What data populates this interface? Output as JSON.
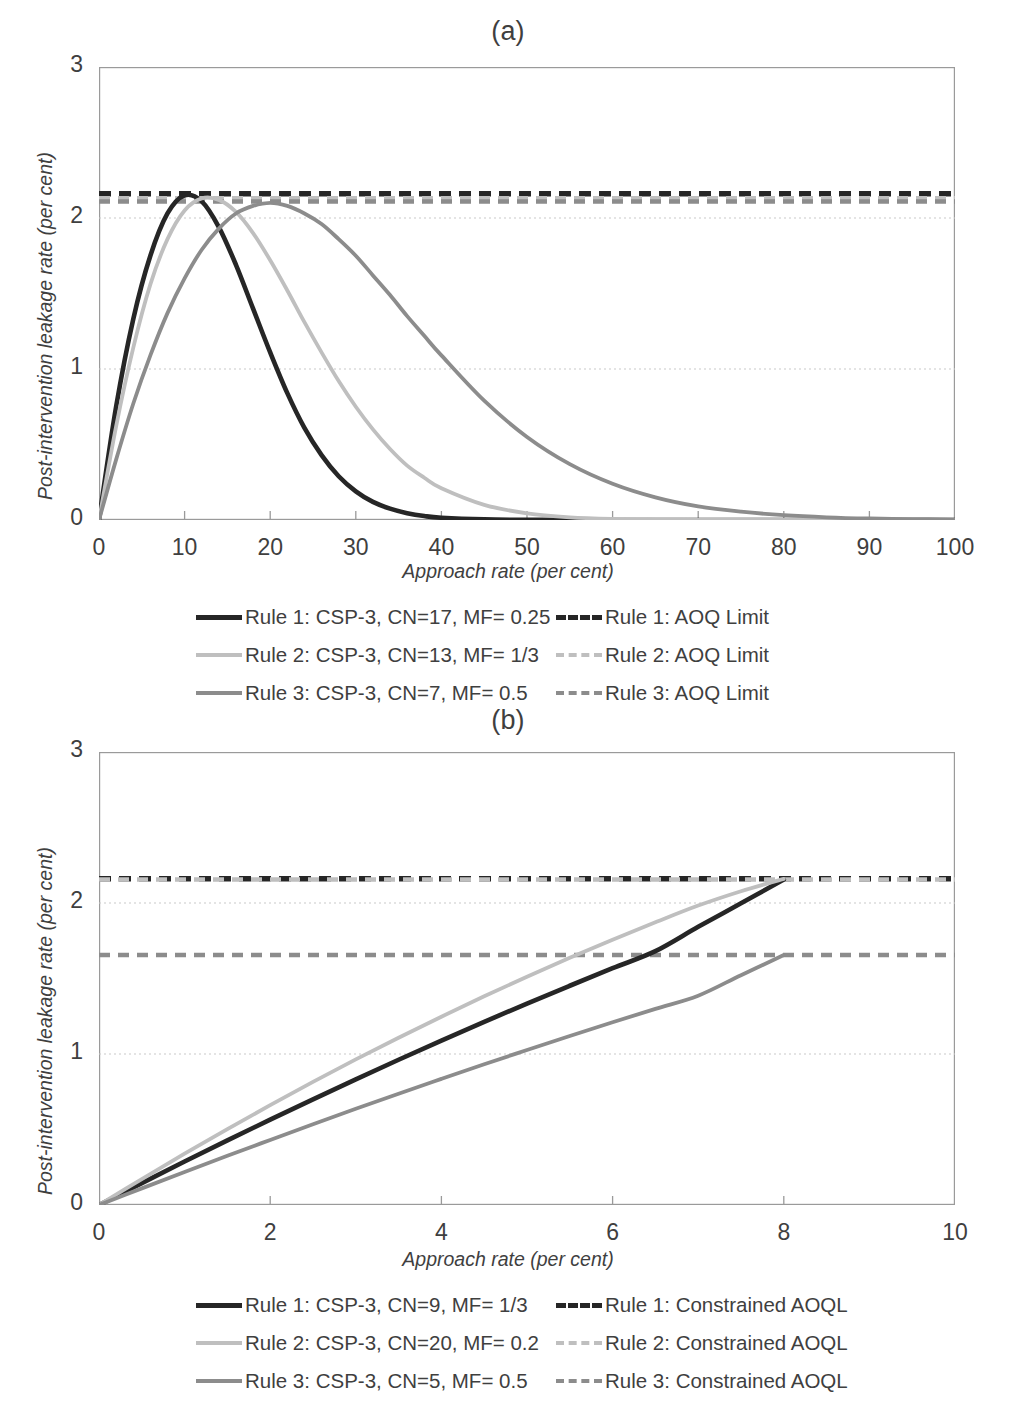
{
  "figure": {
    "panels": [
      {
        "id": "a",
        "title": "(a)",
        "xlabel": "Approach rate (per cent)",
        "ylabel": "Post-intervention leakage rate (per cent)",
        "xticks": [
          "0",
          "10",
          "20",
          "30",
          "40",
          "50",
          "60",
          "70",
          "80",
          "90",
          "100"
        ],
        "yticks": [
          "0",
          "1",
          "2",
          "3"
        ],
        "legend": [
          {
            "label": "Rule 1: CSP-3, CN=17, MF= 0.25",
            "color": "#262626",
            "style": "solid",
            "width": 5
          },
          {
            "label": "Rule 1: AOQ Limit",
            "color": "#262626",
            "style": "dashed",
            "width": 5
          },
          {
            "label": "Rule 2: CSP-3, CN=13, MF= 1/3",
            "color": "#bfbfbf",
            "style": "solid",
            "width": 4
          },
          {
            "label": "Rule 2: AOQ Limit",
            "color": "#bfbfbf",
            "style": "dashed",
            "width": 4
          },
          {
            "label": "Rule 3: CSP-3, CN=7, MF= 0.5",
            "color": "#8c8c8c",
            "style": "solid",
            "width": 4
          },
          {
            "label": "Rule 3: AOQ Limit",
            "color": "#8c8c8c",
            "style": "dashed",
            "width": 4
          }
        ]
      },
      {
        "id": "b",
        "title": "(b)",
        "xlabel": "Approach rate (per cent)",
        "ylabel": "Post-intervention leakage rate (per cent)",
        "xticks": [
          "0",
          "2",
          "4",
          "6",
          "8",
          "10"
        ],
        "yticks": [
          "0",
          "1",
          "2",
          "3"
        ],
        "legend": [
          {
            "label": "Rule 1: CSP-3, CN=9, MF= 1/3",
            "color": "#262626",
            "style": "solid",
            "width": 5
          },
          {
            "label": "Rule 1: Constrained AOQL",
            "color": "#262626",
            "style": "dashed",
            "width": 5
          },
          {
            "label": "Rule 2: CSP-3, CN=20, MF= 0.2",
            "color": "#bfbfbf",
            "style": "solid",
            "width": 4
          },
          {
            "label": "Rule 2: Constrained AOQL",
            "color": "#bfbfbf",
            "style": "dashed",
            "width": 4
          },
          {
            "label": "Rule 3: CSP-3, CN=5, MF= 0.5",
            "color": "#8c8c8c",
            "style": "solid",
            "width": 4
          },
          {
            "label": "Rule 3: Constrained AOQL",
            "color": "#8c8c8c",
            "style": "dashed",
            "width": 4
          }
        ]
      }
    ]
  },
  "chart_data": [
    {
      "type": "line",
      "panel": "a",
      "title": "(a)",
      "xlabel": "Approach rate (per cent)",
      "ylabel": "Post-intervention leakage rate (per cent)",
      "xlim": [
        0,
        100
      ],
      "ylim": [
        0,
        3
      ],
      "xticks": [
        0,
        10,
        20,
        30,
        40,
        50,
        60,
        70,
        80,
        90,
        100
      ],
      "yticks": [
        0,
        1,
        2,
        3
      ],
      "grid": "horizontal-dotted at y=1 and y=2",
      "legend_position": "below-plot-two-columns",
      "x": [
        0,
        2,
        4,
        6,
        8,
        10,
        12,
        14,
        16,
        18,
        20,
        22,
        24,
        26,
        28,
        30,
        32,
        34,
        36,
        38,
        40,
        45,
        50,
        55,
        60,
        65,
        70,
        75,
        80,
        85,
        90,
        95,
        100
      ],
      "series": [
        {
          "name": "Rule 1: CSP-3, CN=17, MF= 0.25",
          "color": "#262626",
          "style": "solid",
          "values": [
            0,
            0.75,
            1.33,
            1.75,
            2.03,
            2.15,
            2.11,
            1.94,
            1.69,
            1.4,
            1.11,
            0.84,
            0.61,
            0.43,
            0.29,
            0.19,
            0.12,
            0.075,
            0.045,
            0.026,
            0.015,
            0.004,
            0.001,
            0.0004,
            0.0001,
            0,
            0,
            0,
            0,
            0,
            0,
            0,
            0
          ]
        },
        {
          "name": "Rule 2: CSP-3, CN=13, MF= 1/3",
          "color": "#bfbfbf",
          "style": "solid",
          "values": [
            0,
            0.62,
            1.14,
            1.56,
            1.86,
            2.05,
            2.13,
            2.12,
            2.04,
            1.9,
            1.72,
            1.52,
            1.31,
            1.11,
            0.92,
            0.75,
            0.6,
            0.47,
            0.36,
            0.28,
            0.21,
            0.1,
            0.044,
            0.018,
            0.007,
            0.003,
            0.001,
            0.0004,
            0.0001,
            0,
            0,
            0,
            0
          ]
        },
        {
          "name": "Rule 3: CSP-3, CN=7, MF= 0.5",
          "color": "#8c8c8c",
          "style": "solid",
          "values": [
            0,
            0.4,
            0.77,
            1.09,
            1.37,
            1.6,
            1.79,
            1.93,
            2.03,
            2.08,
            2.1,
            2.08,
            2.03,
            1.96,
            1.86,
            1.75,
            1.62,
            1.49,
            1.35,
            1.22,
            1.09,
            0.79,
            0.55,
            0.37,
            0.24,
            0.15,
            0.09,
            0.055,
            0.032,
            0.018,
            0.01,
            0.006,
            0.003
          ]
        }
      ],
      "hlines": [
        {
          "name": "Rule 1: AOQ Limit",
          "y": 2.16,
          "color": "#262626",
          "style": "dashed"
        },
        {
          "name": "Rule 2: AOQ Limit",
          "y": 2.13,
          "color": "#bfbfbf",
          "style": "dashed"
        },
        {
          "name": "Rule 3: AOQ Limit",
          "y": 2.11,
          "color": "#8c8c8c",
          "style": "dashed"
        }
      ]
    },
    {
      "type": "line",
      "panel": "b",
      "title": "(b)",
      "xlabel": "Approach rate (per cent)",
      "ylabel": "Post-intervention leakage rate (per cent)",
      "xlim": [
        0,
        10
      ],
      "ylim": [
        0,
        3
      ],
      "xticks": [
        0,
        2,
        4,
        6,
        8,
        10
      ],
      "yticks": [
        0,
        1,
        2,
        3
      ],
      "grid": "horizontal-dotted at y=1 and y=2",
      "legend_position": "below-plot-two-columns",
      "x": [
        0,
        0.5,
        1,
        1.5,
        2,
        2.5,
        3,
        3.5,
        4,
        4.5,
        5,
        5.5,
        6,
        6.5,
        7,
        7.5,
        8
      ],
      "series": [
        {
          "name": "Rule 1: CSP-3, CN=9, MF= 1/3",
          "color": "#262626",
          "style": "solid",
          "values": [
            0,
            0.145,
            0.288,
            0.428,
            0.565,
            0.7,
            0.832,
            0.962,
            1.089,
            1.213,
            1.334,
            1.452,
            1.568,
            1.681,
            1.842,
            1.998,
            2.155
          ]
        },
        {
          "name": "Rule 2: CSP-3, CN=20, MF= 0.2",
          "color": "#bfbfbf",
          "style": "solid",
          "values": [
            0,
            0.172,
            0.34,
            0.503,
            0.661,
            0.815,
            0.964,
            1.108,
            1.247,
            1.382,
            1.512,
            1.637,
            1.757,
            1.872,
            1.983,
            2.078,
            2.16
          ]
        },
        {
          "name": "Rule 3: CSP-3, CN=5, MF= 0.5",
          "color": "#8c8c8c",
          "style": "solid",
          "values": [
            0,
            0.11,
            0.219,
            0.326,
            0.431,
            0.535,
            0.637,
            0.737,
            0.835,
            0.932,
            1.026,
            1.119,
            1.21,
            1.299,
            1.386,
            1.522,
            1.655
          ]
        }
      ],
      "hlines": [
        {
          "name": "Rule 1: Constrained AOQL",
          "y": 2.16,
          "color": "#262626",
          "style": "dashed"
        },
        {
          "name": "Rule 2: Constrained AOQL",
          "y": 2.155,
          "color": "#bfbfbf",
          "style": "dashed"
        },
        {
          "name": "Rule 3: Constrained AOQL",
          "y": 1.655,
          "color": "#8c8c8c",
          "style": "dashed"
        }
      ]
    }
  ]
}
